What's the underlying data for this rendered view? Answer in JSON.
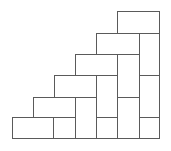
{
  "diagram": {
    "title": "",
    "stroke_color": "#5a5a5a",
    "background": "#ffffff",
    "rects": [
      {
        "x": 12,
        "y": 117,
        "w": 41,
        "h": 21
      },
      {
        "x": 53,
        "y": 117,
        "w": 22,
        "h": 21
      },
      {
        "x": 33,
        "y": 97,
        "w": 42,
        "h": 20
      },
      {
        "x": 75,
        "y": 97,
        "w": 21,
        "h": 41
      },
      {
        "x": 54,
        "y": 75,
        "w": 42,
        "h": 22
      },
      {
        "x": 96,
        "y": 75,
        "w": 21,
        "h": 42
      },
      {
        "x": 96,
        "y": 117,
        "w": 21,
        "h": 21
      },
      {
        "x": 75,
        "y": 54,
        "w": 42,
        "h": 21
      },
      {
        "x": 117,
        "y": 54,
        "w": 22,
        "h": 43
      },
      {
        "x": 117,
        "y": 97,
        "w": 22,
        "h": 41
      },
      {
        "x": 96,
        "y": 33,
        "w": 43,
        "h": 21
      },
      {
        "x": 139,
        "y": 33,
        "w": 20,
        "h": 42
      },
      {
        "x": 139,
        "y": 75,
        "w": 20,
        "h": 42
      },
      {
        "x": 139,
        "y": 117,
        "w": 20,
        "h": 21
      },
      {
        "x": 117,
        "y": 11,
        "w": 42,
        "h": 22
      }
    ]
  }
}
